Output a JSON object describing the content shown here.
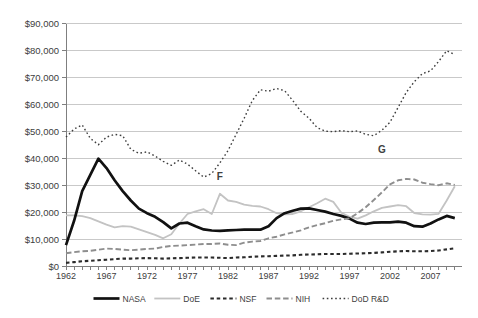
{
  "chart_data": {
    "type": "line",
    "title": "",
    "xlabel": "",
    "ylabel": "",
    "grid": "horizontal",
    "legend_position": "bottom-center",
    "y_axis": {
      "min": 0,
      "max": 90000,
      "step": 10000,
      "tick_labels": [
        "$0",
        "$10,000",
        "$20,000",
        "$30,000",
        "$40,000",
        "$50,000",
        "$60,000",
        "$70,000",
        "$80,000",
        "$90,000"
      ]
    },
    "x_axis": {
      "start_year": 1962,
      "end_year": 2010,
      "minor_tick_every": 1,
      "labeled_ticks": [
        "1962",
        "1967",
        "1972",
        "1977",
        "1982",
        "1987",
        "1992",
        "1997",
        "2002",
        "2007"
      ]
    },
    "series": [
      {
        "name": "NASA",
        "style": "solid-thick",
        "color": "#111111",
        "values": [
          8000,
          17000,
          28000,
          34000,
          40000,
          36500,
          32000,
          28000,
          24500,
          21500,
          19800,
          18500,
          16500,
          14200,
          16000,
          16300,
          15000,
          13800,
          13400,
          13300,
          13500,
          13600,
          13700,
          13700,
          13700,
          15000,
          18000,
          19800,
          20700,
          21500,
          21600,
          21000,
          20400,
          19500,
          18800,
          17800,
          16300,
          15800,
          16300,
          16400,
          16400,
          16700,
          16300,
          15000,
          14800,
          16000,
          17500,
          18800,
          18000
        ]
      },
      {
        "name": "DoE",
        "style": "solid",
        "color": "#c3c3c3",
        "values": [
          19000,
          19000,
          18700,
          18000,
          16800,
          15600,
          14600,
          15000,
          14800,
          13800,
          12800,
          11800,
          10500,
          12000,
          16000,
          19500,
          20500,
          21300,
          19500,
          27000,
          24500,
          24000,
          23000,
          22500,
          22300,
          21300,
          19800,
          19400,
          19500,
          20500,
          22000,
          23500,
          25200,
          24000,
          20000,
          18500,
          17800,
          19000,
          20500,
          21800,
          22300,
          22800,
          22400,
          19900,
          19400,
          19300,
          19600,
          24500,
          29800
        ]
      },
      {
        "name": "NSF",
        "style": "dashed-bold",
        "color": "#2b2b2b",
        "values": [
          1400,
          1700,
          2000,
          2200,
          2400,
          2600,
          2800,
          3000,
          3000,
          3100,
          3200,
          3100,
          3000,
          3100,
          3200,
          3300,
          3400,
          3400,
          3400,
          3300,
          3200,
          3400,
          3500,
          3700,
          3800,
          3900,
          4000,
          4100,
          4200,
          4400,
          4500,
          4600,
          4700,
          4700,
          4700,
          4800,
          4900,
          5000,
          5100,
          5300,
          5500,
          5700,
          5800,
          5700,
          5700,
          5800,
          6000,
          6400,
          6800
        ]
      },
      {
        "name": "NIH",
        "style": "dashed",
        "color": "#8e8e8e",
        "values": [
          5000,
          5400,
          5700,
          5900,
          6300,
          6700,
          6600,
          6300,
          6100,
          6300,
          6600,
          6700,
          7300,
          7700,
          7800,
          8000,
          8200,
          8400,
          8400,
          8600,
          8100,
          8000,
          8900,
          9300,
          9500,
          10500,
          11100,
          12000,
          12700,
          13500,
          14600,
          15400,
          16100,
          17000,
          17500,
          17900,
          19800,
          22000,
          24700,
          27500,
          30500,
          32000,
          32500,
          32300,
          31100,
          30600,
          30200,
          30900,
          30300
        ]
      },
      {
        "name": "DoD R&D",
        "style": "dotted",
        "color": "#3d3d3d",
        "values": [
          48000,
          51000,
          52500,
          47500,
          45200,
          48000,
          49000,
          48500,
          43500,
          42000,
          42500,
          41000,
          39000,
          37500,
          39500,
          38000,
          35500,
          33200,
          34500,
          38500,
          43000,
          49000,
          55000,
          61500,
          65500,
          65000,
          66000,
          65200,
          61500,
          57500,
          55000,
          51500,
          50200,
          50000,
          50400,
          50000,
          50300,
          49000,
          48500,
          50500,
          53500,
          59000,
          64500,
          68500,
          71500,
          72500,
          76000,
          80000,
          78500
        ]
      }
    ],
    "annotations": [
      {
        "text": "F",
        "year": 1981,
        "value": 33300
      },
      {
        "text": "G",
        "year": 2001,
        "value": 43500
      }
    ],
    "colors": {
      "gridline": "#c9c9c9",
      "axis": "#7f7f7f",
      "text": "#404040"
    }
  }
}
